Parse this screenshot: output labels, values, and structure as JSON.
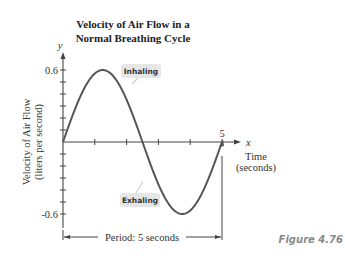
{
  "chart_data": {
    "type": "line",
    "title": "Velocity of Air Flow in a Normal Breathing Cycle",
    "title_lines": [
      "Velocity of Air Flow in a",
      "Normal Breathing Cycle"
    ],
    "xlabel": "Time (seconds)",
    "xlabel_lines": [
      "Time",
      "(seconds)"
    ],
    "ylabel": "Velocity of Air Flow (liters per second)",
    "ylabel_lines": [
      "Velocity of Air Flow",
      "(liters per second)"
    ],
    "x_axis_letter": "x",
    "y_axis_letter": "y",
    "xlim": [
      0,
      5
    ],
    "ylim": [
      -0.6,
      0.6
    ],
    "x_tick_labels": [
      "5"
    ],
    "y_tick_labels": [
      "0.6",
      "-0.6"
    ],
    "x_ticks": [
      1,
      2,
      3,
      4,
      5
    ],
    "y_ticks_step": 0.1,
    "series": [
      {
        "name": "y = 0.6 sin(2πx/5)",
        "x": [
          0,
          0.625,
          1.25,
          1.875,
          2.5,
          3.125,
          3.75,
          4.375,
          5
        ],
        "y": [
          0,
          0.424,
          0.6,
          0.424,
          0,
          -0.424,
          -0.6,
          -0.424,
          0
        ]
      }
    ],
    "annotations": [
      {
        "text": "Inhaling",
        "x": 2.2,
        "y": 0.45
      },
      {
        "text": "Exhaling",
        "x": 2.1,
        "y": -0.45
      },
      {
        "text": "Period: 5 seconds",
        "span": [
          0,
          5
        ]
      }
    ],
    "grid": false,
    "legend": "none"
  },
  "figure_label": "Figure 4.76",
  "colors": {
    "curve": "#555555",
    "axis": "#444444",
    "callout_bg": "#e6e6e6",
    "figure_label": "#8a8a8a"
  }
}
